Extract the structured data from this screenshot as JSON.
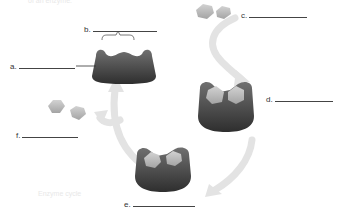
{
  "header": {
    "partial_text": "of an enzyme."
  },
  "footer": {
    "faint_text": "Enzyme cycle"
  },
  "labels": [
    {
      "id": "a",
      "text": "a.",
      "blank_width": 56
    },
    {
      "id": "b",
      "text": "b.",
      "blank_width": 64
    },
    {
      "id": "c",
      "text": "c.",
      "blank_width": 58
    },
    {
      "id": "d",
      "text": "d.",
      "blank_width": 58
    },
    {
      "id": "e",
      "text": "e.",
      "blank_width": 62
    },
    {
      "id": "f",
      "text": "f.",
      "blank_width": 56
    }
  ],
  "colors": {
    "enzyme_dark": "#3f3f3f",
    "enzyme_mid": "#6a6a6a",
    "substrate": "#b8b8b8",
    "arrow": "#e2e2e2",
    "arrow_edge": "#cfcfcf"
  }
}
